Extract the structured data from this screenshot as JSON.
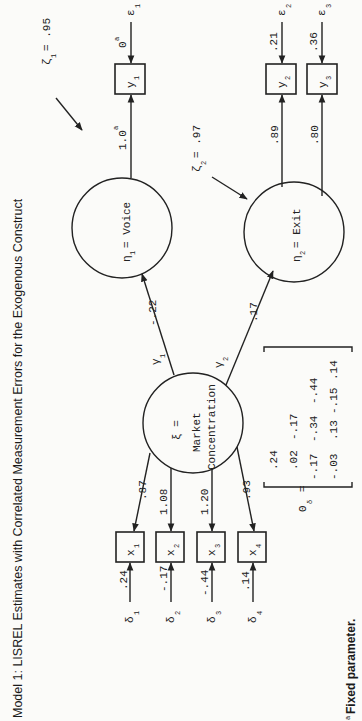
{
  "title": "Model 1: LISREL Estimates with Correlated Measurement Errors for the Exogenous Construct",
  "footnote": "Fixed parameter.",
  "footnote_marker": "a",
  "exogenous": {
    "symbol": "ξ =",
    "label_line1": "Market",
    "label_line2": "Concentration"
  },
  "endogenous": [
    {
      "symbol": "η",
      "sub": "1",
      "label": "= Voice",
      "zeta_symbol": "ζ",
      "zeta_sub": "1",
      "zeta_value": "= .95"
    },
    {
      "symbol": "η",
      "sub": "2",
      "label": "= Exit",
      "zeta_symbol": "ζ",
      "zeta_sub": "2",
      "zeta_value": "= .97"
    }
  ],
  "gammas": [
    {
      "symbol": "γ",
      "sub": "1",
      "value": "-.22"
    },
    {
      "symbol": "γ",
      "sub": "2",
      "value": ".17"
    }
  ],
  "y_indicators": [
    {
      "name": "y",
      "sub": "1",
      "loading": "1.0",
      "loading_sup": "a",
      "error_value": "0",
      "error_sup": "a",
      "error_symbol": "ε",
      "error_sub": "1"
    },
    {
      "name": "y",
      "sub": "2",
      "loading": ".89",
      "error_value": ".21",
      "error_symbol": "ε",
      "error_sub": "2"
    },
    {
      "name": "y",
      "sub": "3",
      "loading": ".80",
      "error_value": ".36",
      "error_symbol": "ε",
      "error_sub": "3"
    }
  ],
  "x_indicators": [
    {
      "name": "x",
      "sub": "1",
      "loading": ".87",
      "error_value": ".24",
      "error_symbol": "δ",
      "error_sub": "1"
    },
    {
      "name": "x",
      "sub": "2",
      "loading": "1.08",
      "error_value": "-.17",
      "error_symbol": "δ",
      "error_sub": "2"
    },
    {
      "name": "x",
      "sub": "3",
      "loading": "1.20",
      "error_value": "-.44",
      "error_symbol": "δ",
      "error_sub": "3"
    },
    {
      "name": "x",
      "sub": "4",
      "loading": ".93",
      "error_value": ".14",
      "error_symbol": "δ",
      "error_sub": "4"
    }
  ],
  "theta_delta": {
    "symbol": "Θ",
    "sub": "δ",
    "equals": "=",
    "rows": [
      [
        ".24"
      ],
      [
        ".02",
        "-.17"
      ],
      [
        "-.17",
        "-.34",
        "-.44"
      ],
      [
        "-.03",
        ".13",
        "-.15",
        ".14"
      ]
    ]
  }
}
